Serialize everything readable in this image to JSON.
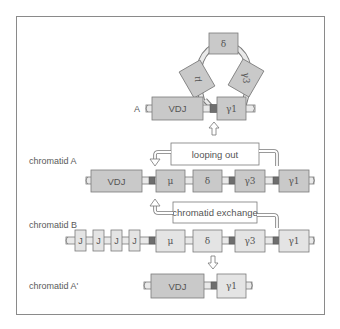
{
  "colors": {
    "frame": "#8a8a8a",
    "gene_dark": "#c9c9c9",
    "gene_light": "#e4e4e4",
    "gene_border": "#7a7a7a",
    "switch_region": "#6e6e6e",
    "dna_strand": "#e9e9e9",
    "text": "#555555"
  },
  "loop_structure": {
    "label": "A",
    "segments": {
      "vdj": "VDJ",
      "gamma1": "γ1",
      "mu": "μ",
      "delta": "δ",
      "gamma3": "γ3"
    }
  },
  "chromatid_a": {
    "label": "chromatid A",
    "genes": [
      "VDJ",
      "μ",
      "δ",
      "γ3",
      "γ1"
    ],
    "annotation": "looping out"
  },
  "chromatid_b": {
    "label": "chromatid B",
    "genes": [
      "J",
      "J",
      "J",
      "J",
      "μ",
      "δ",
      "γ3",
      "γ1"
    ],
    "annotation": "chromatid exchange"
  },
  "chromatid_a_prime": {
    "label": "chromatid A'",
    "genes": [
      "VDJ",
      "γ1"
    ]
  }
}
